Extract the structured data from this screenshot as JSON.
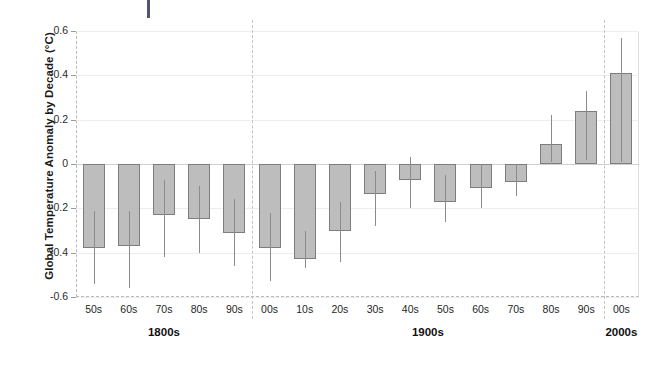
{
  "chart_data": {
    "type": "bar",
    "title": "",
    "subtitle": "",
    "xlabel": "",
    "ylabel": "Global Temperature Anomaly by Decade (°C)",
    "ylim": [
      -0.6,
      0.6
    ],
    "ytick_labels": [
      "0.6",
      "0.4",
      "0.2",
      "0",
      "-0.2",
      "-0.4",
      "-0.6"
    ],
    "ytick_values": [
      0.6,
      0.4,
      0.2,
      0,
      -0.2,
      -0.4,
      -0.6
    ],
    "grid": true,
    "legend": "none",
    "error_bars": true,
    "categories": [
      "50s",
      "60s",
      "70s",
      "80s",
      "90s",
      "00s",
      "10s",
      "20s",
      "30s",
      "40s",
      "50s",
      "60s",
      "70s",
      "80s",
      "90s",
      "00s"
    ],
    "values": [
      -0.38,
      -0.37,
      -0.23,
      -0.25,
      -0.31,
      -0.38,
      -0.43,
      -0.3,
      -0.135,
      -0.07,
      -0.17,
      -0.11,
      -0.08,
      0.09,
      0.24,
      0.41
    ],
    "error_low": [
      -0.54,
      -0.56,
      -0.42,
      -0.4,
      -0.46,
      -0.53,
      -0.47,
      -0.44,
      -0.28,
      -0.2,
      -0.26,
      -0.2,
      -0.145,
      0.01,
      0.02,
      0.01
    ],
    "error_high": [
      -0.21,
      -0.21,
      -0.07,
      -0.1,
      -0.16,
      -0.22,
      -0.3,
      -0.17,
      -0.03,
      0.03,
      -0.05,
      0.0,
      0.0,
      0.22,
      0.33,
      0.57
    ],
    "groups": [
      {
        "label": "1800s",
        "start_index": 0,
        "end_index": 4
      },
      {
        "label": "1900s",
        "start_index": 5,
        "end_index": 14
      },
      {
        "label": "2000s",
        "start_index": 15,
        "end_index": 15
      }
    ],
    "separators_after_index": [
      4,
      14
    ],
    "colors": {
      "bar_fill": "#bdbdbd",
      "bar_border": "#7d7d7d",
      "error_bar": "#8b8b8b",
      "gridline": "#ededed",
      "zeroline": "#cfcfcf",
      "separator": "#c4c4c4",
      "top_mark": "#4d5570",
      "text": "#1f1f1f",
      "background": "#ffffff"
    }
  },
  "marks": {
    "top_tick": "top-blue-tick-mark"
  }
}
